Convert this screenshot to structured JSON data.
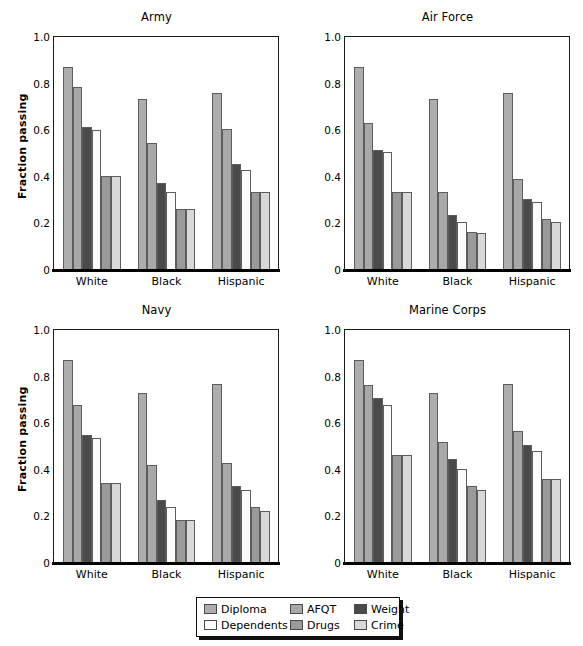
{
  "figure": {
    "ylabel": "Fraction passing",
    "y_ticks": [
      "1.0",
      "0.8",
      "0.6",
      "0.4",
      "0.2",
      "0"
    ],
    "y_tick_values": [
      1.0,
      0.8,
      0.6,
      0.4,
      0.2,
      0.0
    ],
    "categories": [
      "White",
      "Black",
      "Hispanic"
    ]
  },
  "legend": {
    "items": [
      {
        "label": "Diploma",
        "color": "#adadad"
      },
      {
        "label": "AFQT",
        "color": "#a8a8a8"
      },
      {
        "label": "Weight",
        "color": "#4a4a4a"
      },
      {
        "label": "Dependents",
        "color": "#fbfbfb"
      },
      {
        "label": "Drugs",
        "color": "#9a9a9a"
      },
      {
        "label": "Crime",
        "color": "#d8d8d8"
      }
    ]
  },
  "chart_data": [
    {
      "type": "bar",
      "title": "Army",
      "xlabel": "",
      "ylabel": "Fraction passing",
      "ylim": [
        0,
        1.0
      ],
      "grid": false,
      "legend_position": "below-figure",
      "categories": [
        "White",
        "Black",
        "Hispanic"
      ],
      "series": [
        {
          "name": "Diploma",
          "color": "#adadad",
          "values": [
            0.87,
            0.735,
            0.76
          ]
        },
        {
          "name": "AFQT",
          "color": "#a8a8a8",
          "values": [
            0.785,
            0.545,
            0.605
          ]
        },
        {
          "name": "Weight",
          "color": "#4a4a4a",
          "values": [
            0.615,
            0.375,
            0.455
          ]
        },
        {
          "name": "Dependents",
          "color": "#fbfbfb",
          "values": [
            0.6,
            0.335,
            0.43
          ]
        },
        {
          "name": "Drugs",
          "color": "#9a9a9a",
          "values": [
            0.405,
            0.26,
            0.335
          ]
        },
        {
          "name": "Crime",
          "color": "#d8d8d8",
          "values": [
            0.405,
            0.26,
            0.335
          ]
        }
      ]
    },
    {
      "type": "bar",
      "title": "Air Force",
      "xlabel": "",
      "ylabel": "",
      "ylim": [
        0,
        1.0
      ],
      "grid": false,
      "legend_position": "below-figure",
      "categories": [
        "White",
        "Black",
        "Hispanic"
      ],
      "series": [
        {
          "name": "Diploma",
          "color": "#adadad",
          "values": [
            0.87,
            0.735,
            0.76
          ]
        },
        {
          "name": "AFQT",
          "color": "#a8a8a8",
          "values": [
            0.63,
            0.335,
            0.39
          ]
        },
        {
          "name": "Weight",
          "color": "#4a4a4a",
          "values": [
            0.515,
            0.235,
            0.305
          ]
        },
        {
          "name": "Dependents",
          "color": "#fbfbfb",
          "values": [
            0.505,
            0.205,
            0.29
          ]
        },
        {
          "name": "Drugs",
          "color": "#9a9a9a",
          "values": [
            0.335,
            0.165,
            0.22
          ]
        },
        {
          "name": "Crime",
          "color": "#d8d8d8",
          "values": [
            0.335,
            0.16,
            0.205
          ]
        }
      ]
    },
    {
      "type": "bar",
      "title": "Navy",
      "xlabel": "",
      "ylabel": "Fraction passing",
      "ylim": [
        0,
        1.0
      ],
      "grid": false,
      "legend_position": "below-figure",
      "categories": [
        "White",
        "Black",
        "Hispanic"
      ],
      "series": [
        {
          "name": "Diploma",
          "color": "#adadad",
          "values": [
            0.87,
            0.73,
            0.77
          ]
        },
        {
          "name": "AFQT",
          "color": "#a8a8a8",
          "values": [
            0.68,
            0.42,
            0.43
          ]
        },
        {
          "name": "Weight",
          "color": "#4a4a4a",
          "values": [
            0.55,
            0.27,
            0.33
          ]
        },
        {
          "name": "Dependents",
          "color": "#fbfbfb",
          "values": [
            0.535,
            0.24,
            0.315
          ]
        },
        {
          "name": "Drugs",
          "color": "#9a9a9a",
          "values": [
            0.345,
            0.185,
            0.24
          ]
        },
        {
          "name": "Crime",
          "color": "#d8d8d8",
          "values": [
            0.345,
            0.185,
            0.225
          ]
        }
      ]
    },
    {
      "type": "bar",
      "title": "Marine Corps",
      "xlabel": "",
      "ylabel": "",
      "ylim": [
        0,
        1.0
      ],
      "grid": false,
      "legend_position": "below-figure",
      "categories": [
        "White",
        "Black",
        "Hispanic"
      ],
      "series": [
        {
          "name": "Diploma",
          "color": "#adadad",
          "values": [
            0.87,
            0.73,
            0.77
          ]
        },
        {
          "name": "AFQT",
          "color": "#a8a8a8",
          "values": [
            0.765,
            0.52,
            0.565
          ]
        },
        {
          "name": "Weight",
          "color": "#4a4a4a",
          "values": [
            0.71,
            0.445,
            0.505
          ]
        },
        {
          "name": "Dependents",
          "color": "#fbfbfb",
          "values": [
            0.68,
            0.405,
            0.48
          ]
        },
        {
          "name": "Drugs",
          "color": "#9a9a9a",
          "values": [
            0.465,
            0.33,
            0.36
          ]
        },
        {
          "name": "Crime",
          "color": "#d8d8d8",
          "values": [
            0.465,
            0.315,
            0.36
          ]
        }
      ]
    }
  ]
}
